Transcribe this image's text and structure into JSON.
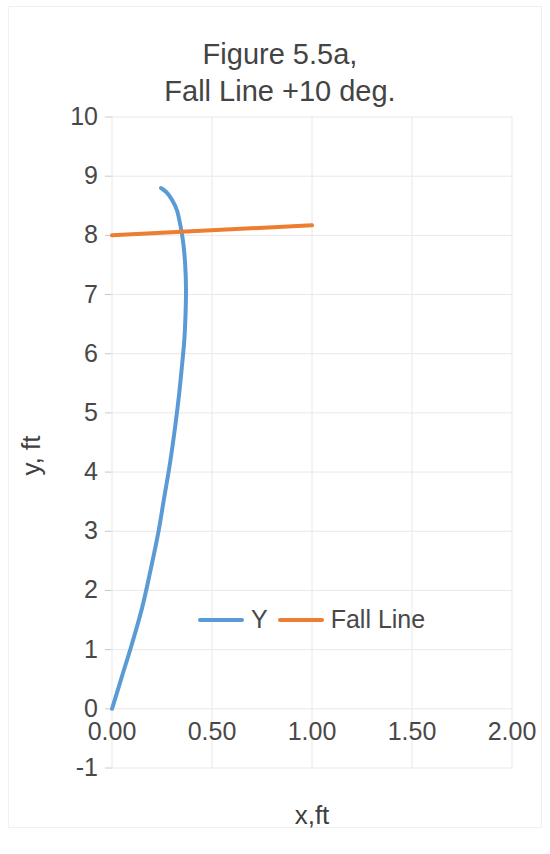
{
  "chart_data": {
    "type": "line",
    "title_line1": "Figure 5.5a,",
    "title_line2": "Fall Line +10 deg.",
    "xlabel": "x,ft",
    "ylabel": "y, ft",
    "xlim": [
      0.0,
      2.0
    ],
    "ylim": [
      -1,
      10
    ],
    "xticks": [
      "0.00",
      "0.50",
      "1.00",
      "1.50",
      "2.00"
    ],
    "xtick_values": [
      0.0,
      0.5,
      1.0,
      1.5,
      2.0
    ],
    "yticks": [
      "10",
      "9",
      "8",
      "7",
      "6",
      "5",
      "4",
      "3",
      "2",
      "1",
      "0",
      "-1"
    ],
    "ytick_values": [
      10,
      9,
      8,
      7,
      6,
      5,
      4,
      3,
      2,
      1,
      0,
      -1
    ],
    "grid": true,
    "legend_position": "inside-lower-center",
    "series": [
      {
        "name": "Y",
        "color": "#5B9BD5",
        "points": [
          [
            0.0,
            0.0
          ],
          [
            0.05,
            0.55
          ],
          [
            0.1,
            1.1
          ],
          [
            0.15,
            1.7
          ],
          [
            0.19,
            2.3
          ],
          [
            0.23,
            2.95
          ],
          [
            0.26,
            3.55
          ],
          [
            0.29,
            4.15
          ],
          [
            0.315,
            4.75
          ],
          [
            0.335,
            5.3
          ],
          [
            0.35,
            5.8
          ],
          [
            0.362,
            6.25
          ],
          [
            0.368,
            6.7
          ],
          [
            0.37,
            7.1
          ],
          [
            0.366,
            7.5
          ],
          [
            0.357,
            7.85
          ],
          [
            0.343,
            8.15
          ],
          [
            0.325,
            8.42
          ],
          [
            0.3,
            8.6
          ],
          [
            0.272,
            8.73
          ],
          [
            0.245,
            8.8
          ]
        ]
      },
      {
        "name": "Fall Line",
        "color": "#ED7D31",
        "points": [
          [
            0.0,
            8.0
          ],
          [
            1.0,
            8.17
          ]
        ]
      }
    ]
  },
  "legend": {
    "entries": [
      {
        "label": "Y",
        "color": "#5B9BD5"
      },
      {
        "label": "Fall Line",
        "color": "#ED7D31"
      }
    ]
  },
  "colors": {
    "series_y": "#5B9BD5",
    "series_fall_line": "#ED7D31",
    "grid": "#e8e8e8",
    "text": "#404040",
    "background": "#ffffff"
  }
}
